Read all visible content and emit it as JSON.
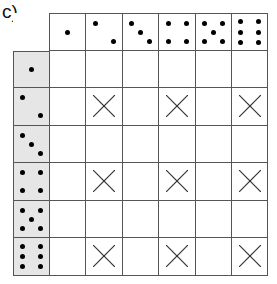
{
  "label": "c)",
  "columns": [
    1,
    2,
    3,
    4,
    5,
    6
  ],
  "rows": [
    1,
    2,
    3,
    4,
    5,
    6
  ],
  "marked_cells": [
    [
      2,
      2
    ],
    [
      2,
      4
    ],
    [
      2,
      6
    ],
    [
      4,
      2
    ],
    [
      4,
      4
    ],
    [
      4,
      6
    ],
    [
      6,
      2
    ],
    [
      6,
      4
    ],
    [
      6,
      6
    ]
  ],
  "mark_symbol": "cross",
  "colors": {
    "grid_line": "#555555",
    "row_header_bg": "#e6e6e6",
    "pip": "#000000",
    "cross": "#333333"
  }
}
